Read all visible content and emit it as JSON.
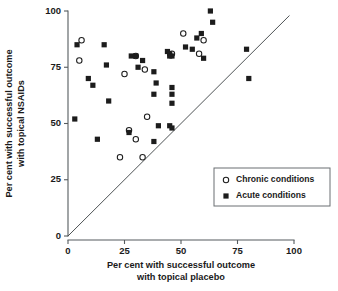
{
  "chart_data": {
    "type": "scatter",
    "title": "",
    "xlabel": "Per cent with successful outcome with topical placebo",
    "xlabel_line1": "Per cent with successful outcome",
    "xlabel_line2": "with topical placebo",
    "ylabel": "Per cent with successful outcome with topical NSAIDs",
    "ylabel_line1": "Per cent with successful outcome",
    "ylabel_line2": "with topical NSAIDs",
    "xlim": [
      0,
      100
    ],
    "ylim": [
      0,
      100
    ],
    "xticks": [
      0,
      25,
      50,
      75,
      100
    ],
    "yticks": [
      0,
      25,
      50,
      75,
      100
    ],
    "xtick_labels": [
      "0",
      "25",
      "50",
      "75",
      "100"
    ],
    "ytick_labels": [
      "0",
      "25",
      "50",
      "75",
      "100"
    ],
    "grid": false,
    "legend_position": "lower-right",
    "reference_line": {
      "name": "line-of-equality",
      "from": [
        0,
        0
      ],
      "to": [
        98,
        98
      ],
      "slope": 1,
      "intercept": 0
    },
    "series": [
      {
        "name": "Chronic conditions",
        "marker": "open-circle",
        "color": "#ffffff",
        "edge_color": "#1c1c1c",
        "points": [
          [
            6,
            87
          ],
          [
            5,
            78
          ],
          [
            25,
            72
          ],
          [
            30,
            80
          ],
          [
            34,
            74
          ],
          [
            27,
            47
          ],
          [
            30,
            43
          ],
          [
            23,
            35
          ],
          [
            33,
            35
          ],
          [
            35,
            53
          ],
          [
            46,
            81
          ],
          [
            51,
            90
          ],
          [
            58,
            81
          ],
          [
            60,
            87
          ]
        ]
      },
      {
        "name": "Acute conditions",
        "marker": "filled-square",
        "color": "#1c1c1c",
        "points": [
          [
            4,
            85
          ],
          [
            3,
            52
          ],
          [
            9,
            70
          ],
          [
            11,
            67
          ],
          [
            13,
            43
          ],
          [
            16,
            85
          ],
          [
            17,
            76
          ],
          [
            18,
            60
          ],
          [
            28,
            80
          ],
          [
            30,
            80
          ],
          [
            31,
            75
          ],
          [
            33,
            78
          ],
          [
            27,
            46
          ],
          [
            38,
            73
          ],
          [
            38,
            63
          ],
          [
            38,
            42
          ],
          [
            39,
            68
          ],
          [
            40,
            49
          ],
          [
            44,
            82
          ],
          [
            45,
            81
          ],
          [
            45,
            80
          ],
          [
            46,
            80
          ],
          [
            46,
            66
          ],
          [
            46,
            63
          ],
          [
            46,
            59
          ],
          [
            45,
            49
          ],
          [
            46,
            48
          ],
          [
            52,
            84
          ],
          [
            55,
            83
          ],
          [
            57,
            88
          ],
          [
            59,
            90
          ],
          [
            60,
            79
          ],
          [
            63,
            100
          ],
          [
            64,
            95
          ],
          [
            79,
            83
          ],
          [
            80,
            70
          ]
        ]
      }
    ],
    "legend_entries": [
      {
        "label": "Chronic conditions",
        "marker": "open-circle"
      },
      {
        "label": "Acute conditions",
        "marker": "filled-square"
      }
    ]
  }
}
